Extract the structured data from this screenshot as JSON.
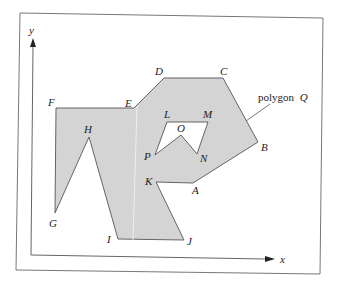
{
  "diagram": {
    "title_label": "polygon",
    "title_var": "Q",
    "axes": {
      "x_label": "x",
      "y_label": "y"
    },
    "colors": {
      "fill": "#d4d4d4",
      "stroke": "#555555",
      "frame": "#666666"
    },
    "outer_vertices": [
      {
        "name": "A",
        "x": 193,
        "y": 183
      },
      {
        "name": "B",
        "x": 258,
        "y": 142
      },
      {
        "name": "C",
        "x": 223,
        "y": 78
      },
      {
        "name": "D",
        "x": 164,
        "y": 78
      },
      {
        "name": "E",
        "x": 134,
        "y": 108
      },
      {
        "name": "F",
        "x": 56,
        "y": 108
      },
      {
        "name": "G",
        "x": 55,
        "y": 213
      },
      {
        "name": "H",
        "x": 89,
        "y": 137
      },
      {
        "name": "I",
        "x": 118,
        "y": 239
      },
      {
        "name": "J",
        "x": 184,
        "y": 240
      },
      {
        "name": "K",
        "x": 156,
        "y": 182
      }
    ],
    "hole_vertices": [
      {
        "name": "L",
        "x": 167,
        "y": 122
      },
      {
        "name": "M",
        "x": 208,
        "y": 122
      },
      {
        "name": "N",
        "x": 197,
        "y": 154
      },
      {
        "name": "O",
        "x": 181,
        "y": 135
      },
      {
        "name": "P",
        "x": 155,
        "y": 155
      }
    ],
    "labels": {
      "A": "A",
      "B": "B",
      "C": "C",
      "D": "D",
      "E": "E",
      "F": "F",
      "G": "G",
      "H": "H",
      "I": "I",
      "J": "J",
      "K": "K",
      "L": "L",
      "M": "M",
      "N": "N",
      "O": "O",
      "P": "P"
    }
  }
}
